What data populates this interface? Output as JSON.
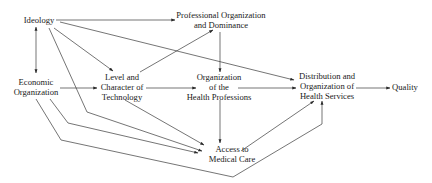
{
  "diagram": {
    "type": "flow-diagram",
    "nodes": {
      "ideology": {
        "lines": [
          "Ideology"
        ]
      },
      "professional_org": {
        "lines": [
          "Professional Organization",
          "and Dominance"
        ]
      },
      "economic_org": {
        "lines": [
          "Economic",
          "Organization"
        ]
      },
      "technology": {
        "lines": [
          "Level and",
          "Character of",
          "Technology"
        ]
      },
      "health_professions": {
        "lines": [
          "Organization",
          "of the",
          "Health Professions"
        ]
      },
      "distribution": {
        "lines": [
          "Distribution and",
          "Organization of",
          "Health Services"
        ]
      },
      "quality": {
        "lines": [
          "Quality"
        ]
      },
      "access": {
        "lines": [
          "Access to",
          "Medical Care"
        ]
      }
    },
    "edges": [
      {
        "from": "Ideology",
        "to": "Professional Organization and Dominance"
      },
      {
        "from": "Ideology",
        "to": "Economic Organization",
        "bidirectional": true
      },
      {
        "from": "Ideology",
        "to": "Level and Character of Technology"
      },
      {
        "from": "Ideology",
        "to": "Distribution and Organization of Health Services"
      },
      {
        "from": "Ideology",
        "to": "Access to Medical Care"
      },
      {
        "from": "Level and Character of Technology",
        "to": "Professional Organization and Dominance"
      },
      {
        "from": "Professional Organization and Dominance",
        "to": "Organization of the Health Professions"
      },
      {
        "from": "Economic Organization",
        "to": "Level and Character of Technology"
      },
      {
        "from": "Level and Character of Technology",
        "to": "Organization of the Health Professions"
      },
      {
        "from": "Organization of the Health Professions",
        "to": "Distribution and Organization of Health Services"
      },
      {
        "from": "Distribution and Organization of Health Services",
        "to": "Quality"
      },
      {
        "from": "Level and Character of Technology",
        "to": "Access to Medical Care"
      },
      {
        "from": "Organization of the Health Professions",
        "to": "Access to Medical Care"
      },
      {
        "from": "Economic Organization",
        "to": "Access to Medical Care"
      },
      {
        "from": "Economic Organization",
        "to": "Distribution and Organization of Health Services"
      },
      {
        "from": "Access to Medical Care",
        "to": "Distribution and Organization of Health Services"
      }
    ],
    "colors": {
      "line": "#3a3a3a",
      "text": "#1a1a1a",
      "background": "#ffffff"
    }
  }
}
